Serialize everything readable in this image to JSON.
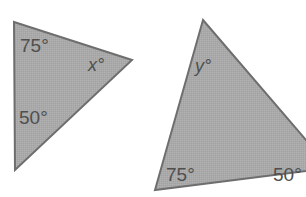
{
  "figure": {
    "background_color": "#ffffff",
    "shape_fill_color": "#a9a9a9",
    "shape_stroke_color": "#6e6e6e",
    "label_text_color": "#4f4f4f",
    "shapes": [
      {
        "name": "left-triangle",
        "points": "14,22 132,60 15,170",
        "labels": [
          {
            "name": "angle-75-left-triangle",
            "text": "75°",
            "value": "75",
            "unit": "°",
            "x": 20,
            "y": 52,
            "style": "plain"
          },
          {
            "name": "angle-x-left-triangle",
            "text": "x°",
            "value": "x",
            "unit": "°",
            "x": 88,
            "y": 71,
            "style": "variable"
          },
          {
            "name": "angle-50-left-triangle",
            "text": "50°",
            "value": "50",
            "unit": "°",
            "x": 19,
            "y": 124,
            "style": "plain"
          }
        ]
      },
      {
        "name": "right-triangle",
        "points": "203,20 330,168 155,190",
        "labels": [
          {
            "name": "angle-y-right-triangle",
            "text": "y°",
            "value": "y",
            "unit": "°",
            "x": 195,
            "y": 72,
            "style": "variable"
          },
          {
            "name": "angle-75-right-triangle",
            "text": "75°",
            "value": "75",
            "unit": "°",
            "x": 166,
            "y": 181,
            "style": "plain"
          },
          {
            "name": "angle-50-right-triangle",
            "text": "50°",
            "value": "50",
            "unit": "°",
            "x": 273,
            "y": 181,
            "style": "plain"
          }
        ]
      }
    ]
  }
}
